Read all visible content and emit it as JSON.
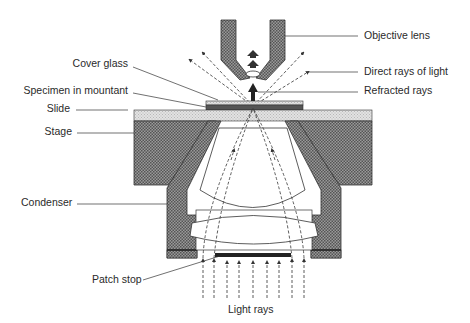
{
  "diagram": {
    "colors": {
      "stipple": "#7a7a7a",
      "line": "#333333",
      "slide": "#d6d6d6",
      "stop": "#222222"
    },
    "labels": {
      "objective_lens": "Objective lens",
      "direct_rays": "Direct rays of light",
      "refracted_rays": "Refracted rays",
      "cover_glass": "Cover glass",
      "specimen": "Specimen in mountant",
      "slide": "Slide",
      "stage": "Stage",
      "condenser": "Condenser",
      "patch_stop": "Patch stop",
      "light_rays": "Light rays"
    }
  }
}
